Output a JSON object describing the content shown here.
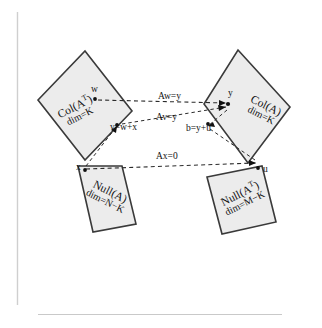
{
  "figure": {
    "type": "four-fundamental-subspaces-diagram",
    "background_color": "#ffffff",
    "box_fill_color": "#ececec",
    "box_stroke_color": "#3a3a3a",
    "line_color": "#2b2b2b",
    "rule_color": "#cfcfcf"
  },
  "boxes": {
    "row_space": {
      "title_main": "Col(A",
      "title_sup": "T",
      "title_tail": ")",
      "dim": "dim=K"
    },
    "col_space": {
      "title_main": "Col(A)",
      "title_sup": "",
      "title_tail": "",
      "dim": "dim=K"
    },
    "null_space": {
      "title_main": "Null(A)",
      "title_sup": "",
      "title_tail": "",
      "dim": "dim=N−K"
    },
    "left_null_space": {
      "title_main": "Null(A",
      "title_sup": "T",
      "title_tail": ")",
      "dim": "dim=M−K"
    }
  },
  "points": {
    "w": "w",
    "x": "x",
    "y": "y",
    "u": "u"
  },
  "equations": {
    "aw_eq_y": "Aw=y",
    "av_eq_y": "Av=y",
    "ax_eq_0": "Ax=0",
    "v_eq_w_plus_x": "v=w+x",
    "b_eq_y_plus_u": "b=y+u"
  }
}
